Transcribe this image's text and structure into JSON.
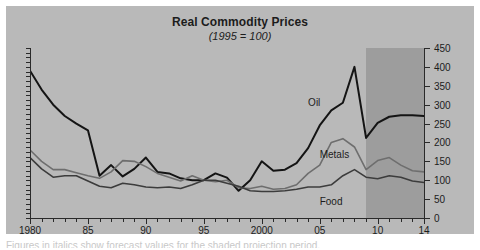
{
  "chart_data": {
    "type": "line",
    "title": "Real Commodity Prices",
    "subtitle": "(1995 = 100)",
    "xlabel": "",
    "ylabel": "",
    "xlim": [
      1980,
      2014
    ],
    "ylim": [
      0,
      450
    ],
    "yticks": [
      0,
      50,
      100,
      150,
      200,
      250,
      300,
      350,
      400,
      450
    ],
    "ytick_labels": [
      "0",
      "50",
      "100",
      "150",
      "200",
      "250",
      "300",
      "350",
      "400",
      "450"
    ],
    "y_axis_position": "right",
    "xticks": [
      1980,
      1985,
      1990,
      1995,
      2000,
      2005,
      2010,
      2014
    ],
    "xtick_labels": [
      "1980",
      "85",
      "90",
      "95",
      "2000",
      "05",
      "10",
      "14"
    ],
    "x_minor_tick_interval": 1,
    "grid": false,
    "legend": "inline-labels",
    "shaded_region": {
      "label": "forecast",
      "x_start": 2009,
      "x_end": 2014,
      "color": "#9d9d9d"
    },
    "background_color": "#b9b9b9",
    "x": [
      1980,
      1981,
      1982,
      1983,
      1984,
      1985,
      1986,
      1987,
      1988,
      1989,
      1990,
      1991,
      1992,
      1993,
      1994,
      1995,
      1996,
      1997,
      1998,
      1999,
      2000,
      2001,
      2002,
      2003,
      2004,
      2005,
      2006,
      2007,
      2008,
      2009,
      2010,
      2011,
      2012,
      2013,
      2014
    ],
    "series": [
      {
        "name": "Oil",
        "color": "#141414",
        "width": 2.0,
        "label_x": 2004,
        "label_y": 320,
        "values": [
          390,
          340,
          300,
          270,
          250,
          232,
          112,
          140,
          110,
          130,
          160,
          122,
          118,
          105,
          100,
          100,
          118,
          107,
          72,
          100,
          150,
          125,
          128,
          145,
          185,
          245,
          285,
          305,
          400,
          212,
          252,
          268,
          272,
          272,
          270
        ]
      },
      {
        "name": "Metals",
        "color": "#6e6e6e",
        "width": 1.6,
        "label_x": 2005,
        "label_y": 182,
        "values": [
          180,
          150,
          128,
          128,
          120,
          112,
          105,
          122,
          152,
          150,
          136,
          118,
          108,
          98,
          112,
          100,
          96,
          100,
          80,
          78,
          84,
          76,
          78,
          88,
          118,
          140,
          200,
          210,
          188,
          128,
          152,
          160,
          140,
          125,
          122
        ]
      },
      {
        "name": "Food",
        "color": "#3c3c3c",
        "width": 1.6,
        "label_x": 2005,
        "label_y": 58,
        "values": [
          160,
          130,
          108,
          112,
          112,
          98,
          84,
          80,
          92,
          88,
          82,
          80,
          82,
          78,
          88,
          100,
          100,
          92,
          84,
          72,
          70,
          70,
          72,
          76,
          82,
          82,
          88,
          112,
          128,
          108,
          104,
          112,
          108,
          98,
          94
        ]
      }
    ]
  },
  "caption_sliver": "Figures in italics show forecast values for the shaded projection period."
}
